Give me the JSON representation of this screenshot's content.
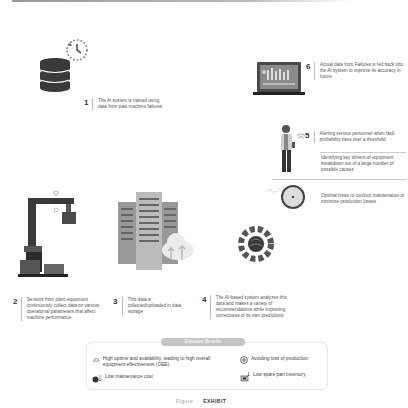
{
  "steps": [
    {
      "num": "1",
      "text": "The AI system is trained using data from past machine failures"
    },
    {
      "num": "2",
      "text": "Sensors from plant equipment continuously collect data on various operational parameters that affect machine performance"
    },
    {
      "num": "3",
      "text": "This data is collected/uploaded in data storage"
    },
    {
      "num": "4",
      "text": "The AI-based system analyzes this data and makes a variety of recommendations while improving correctness of its own predictions"
    },
    {
      "num": "5",
      "text": "Alerting service personnel when fault probability rises over a threshold"
    },
    {
      "num": "6",
      "text": "Actual data from Failures is fed back into the AI system to improve its accuracy in future"
    }
  ],
  "recommendations": [
    "Identifying key drivers of equipment breakdown out of a large number of possible causes",
    "Optimal times to conduct maintenance to minimize production losses"
  ],
  "benefits": {
    "title": "Expected Benefits",
    "items": [
      {
        "icon": "gauge-icon",
        "text": "High uptime and availability, leading to high overall equipment effectiveness (OEE)"
      },
      {
        "icon": "no-loss-icon",
        "text": "Avoiding loss of production"
      },
      {
        "icon": "money-down-icon",
        "text": "Low maintenance cost"
      },
      {
        "icon": "inventory-down-icon",
        "text": "Low spare part inventory"
      }
    ]
  },
  "caption": {
    "prefix": "Figure",
    "title": "EXHIBIT"
  },
  "colors": {
    "icon_dark": "#3a3a3a",
    "icon_mid": "#6a6a6a",
    "icon_light": "#bdbdbd",
    "text": "#555555"
  }
}
